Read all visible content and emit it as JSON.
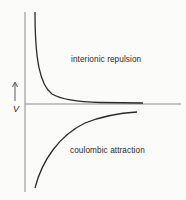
{
  "diagram": {
    "axis_label_y": "V",
    "curves": [
      {
        "name": "interionic repulsion",
        "label": "interionic repulsion"
      },
      {
        "name": "coulombic attraction",
        "label": "coulombic attraction"
      }
    ],
    "colors": {
      "background": "#fbfbfa",
      "line": "#2a2a2a",
      "axis": "#7a7a7a"
    }
  }
}
